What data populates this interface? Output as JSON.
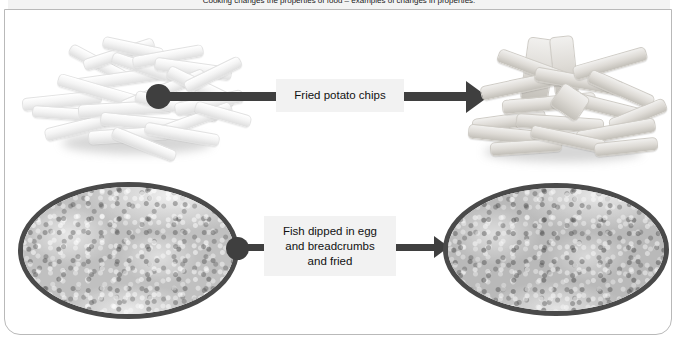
{
  "slide": {
    "header_text": "Cooking changes the properties of food – examples of changes in properties:",
    "background_color": "#ffffff",
    "frame_border_color": "#b9b9b9"
  },
  "process_rows": [
    {
      "id": "potato-chips",
      "before": {
        "name": "raw-potato-chips-image",
        "alt": "Pile of raw pale potato chips"
      },
      "label": {
        "lines": [
          "Fried potato chips"
        ],
        "background": "#f2f2f2",
        "text_color": "#111111"
      },
      "after": {
        "name": "fried-potato-chips-image",
        "alt": "Pile of cooked golden fried potato chips"
      },
      "connector": {
        "dot_color": "#3f3f3f",
        "line_color": "#3f3f3f",
        "arrow_color": "#3f3f3f"
      }
    },
    {
      "id": "fish-breadcrumbs",
      "before": {
        "name": "raw-breaded-fish-image",
        "alt": "Oval photo of raw fish coated in breadcrumbs"
      },
      "label": {
        "lines": [
          "Fish dipped in egg",
          "and breadcrumbs",
          "and fried"
        ],
        "background": "#f2f2f2",
        "text_color": "#111111"
      },
      "after": {
        "name": "fried-breaded-fish-image",
        "alt": "Oval photo of fried breaded fish"
      },
      "connector": {
        "dot_color": "#3f3f3f",
        "line_color": "#3f3f3f",
        "arrow_color": "#3f3f3f"
      }
    }
  ]
}
